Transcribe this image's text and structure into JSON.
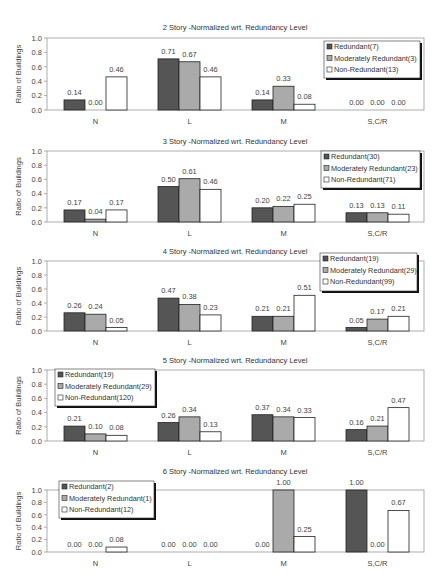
{
  "figure": {
    "ylabel": "Ratio of Buildings",
    "categories": [
      "N",
      "L",
      "M",
      "S,C/R"
    ],
    "series_colors": {
      "Redundant": "#555555",
      "Moderately Redundant": "#aaaaaa",
      "Non-Redundant": "#ffffff"
    },
    "yticks": [
      "0.0",
      "0.2",
      "0.4",
      "0.6",
      "0.8",
      "1.0"
    ]
  },
  "chart_data": [
    {
      "type": "bar",
      "title": "2 Story -Normalized wrt. Redundancy Level",
      "xlabel": "",
      "ylabel": "Ratio of Buildings",
      "ylim": [
        0,
        1.0
      ],
      "categories": [
        "N",
        "L",
        "M",
        "S,C/R"
      ],
      "legend_position": "top-right",
      "series": [
        {
          "name": "Redundant(7)",
          "values": [
            0.14,
            0.71,
            0.14,
            0.0
          ]
        },
        {
          "name": "Moderately Redundant(3)",
          "values": [
            0.0,
            0.67,
            0.33,
            0.0
          ]
        },
        {
          "name": "Non-Redundant(13)",
          "values": [
            0.46,
            0.46,
            0.08,
            0.0
          ]
        }
      ]
    },
    {
      "type": "bar",
      "title": "3 Story -Normalized wrt. Redundancy Level",
      "xlabel": "",
      "ylabel": "Ratio of Buildings",
      "ylim": [
        0,
        1.0
      ],
      "categories": [
        "N",
        "L",
        "M",
        "S,C/R"
      ],
      "legend_position": "top-right",
      "series": [
        {
          "name": "Redundant(30)",
          "values": [
            0.17,
            0.5,
            0.2,
            0.13
          ]
        },
        {
          "name": "Moderately Redundant(23)",
          "values": [
            0.04,
            0.61,
            0.22,
            0.13
          ]
        },
        {
          "name": "Non-Redundant(71)",
          "values": [
            0.17,
            0.46,
            0.25,
            0.11
          ]
        }
      ]
    },
    {
      "type": "bar",
      "title": "4 Story -Normalized wrt. Redundancy Level",
      "xlabel": "",
      "ylabel": "Ratio of Buildings",
      "ylim": [
        0,
        1.0
      ],
      "categories": [
        "N",
        "L",
        "M",
        "S,C/R"
      ],
      "legend_position": "top-right-overlapping",
      "series": [
        {
          "name": "Redundant(19)",
          "values": [
            0.26,
            0.47,
            0.21,
            0.05
          ]
        },
        {
          "name": "Moderately Redundant(29)",
          "values": [
            0.24,
            0.38,
            0.21,
            0.17
          ]
        },
        {
          "name": "Non-Redundant(99)",
          "values": [
            0.05,
            0.23,
            0.51,
            0.21
          ]
        }
      ]
    },
    {
      "type": "bar",
      "title": "5 Story -Normalized wrt. Redundancy Level",
      "xlabel": "",
      "ylabel": "Ratio of Buildings",
      "ylim": [
        0,
        1.0
      ],
      "categories": [
        "N",
        "L",
        "M",
        "S,C/R"
      ],
      "legend_position": "top-left",
      "series": [
        {
          "name": "Redundant(19)",
          "values": [
            0.21,
            0.26,
            0.37,
            0.16
          ]
        },
        {
          "name": "Moderately Redundant(29)",
          "values": [
            0.1,
            0.34,
            0.34,
            0.21
          ]
        },
        {
          "name": "Non-Redundant(120)",
          "values": [
            0.08,
            0.13,
            0.33,
            0.47
          ]
        }
      ]
    },
    {
      "type": "bar",
      "title": "6 Story -Normalized wrt. Redundancy Level",
      "xlabel": "",
      "ylabel": "Ratio of Buildings",
      "ylim": [
        0,
        1.0
      ],
      "categories": [
        "N",
        "L",
        "M",
        "S,C/R"
      ],
      "legend_position": "top-left",
      "series": [
        {
          "name": "Redundant(2)",
          "values": [
            0.0,
            0.0,
            0.0,
            1.0
          ]
        },
        {
          "name": "Moderately Redundant(1)",
          "values": [
            0.0,
            0.0,
            1.0,
            0.0
          ]
        },
        {
          "name": "Non-Redundant(12)",
          "values": [
            0.08,
            0.0,
            0.25,
            0.67
          ]
        }
      ]
    }
  ],
  "layout": {
    "panels": [
      {
        "title_y": 30,
        "top": 38,
        "base": 110,
        "cat_y": 124,
        "legend": {
          "x": 324,
          "y": 41,
          "w": 96,
          "h": 37
        }
      },
      {
        "title_y": 144,
        "top": 151,
        "base": 222,
        "cat_y": 236,
        "legend": {
          "x": 321,
          "y": 151,
          "w": 99,
          "h": 37
        }
      },
      {
        "title_y": 254,
        "top": 261,
        "base": 331,
        "cat_y": 345,
        "legend": {
          "x": 320,
          "y": 253,
          "w": 97,
          "h": 38
        }
      },
      {
        "title_y": 363,
        "top": 370,
        "base": 441,
        "cat_y": 455,
        "legend": {
          "x": 55,
          "y": 369,
          "w": 100,
          "h": 37
        }
      },
      {
        "title_y": 474,
        "top": 490,
        "base": 552,
        "cat_y": 566,
        "legend": {
          "x": 59,
          "y": 481,
          "w": 95,
          "h": 37
        }
      }
    ],
    "plot_left": 47,
    "plot_right": 424,
    "group_starts": [
      64,
      158,
      252,
      346
    ],
    "bar_width": 21
  }
}
